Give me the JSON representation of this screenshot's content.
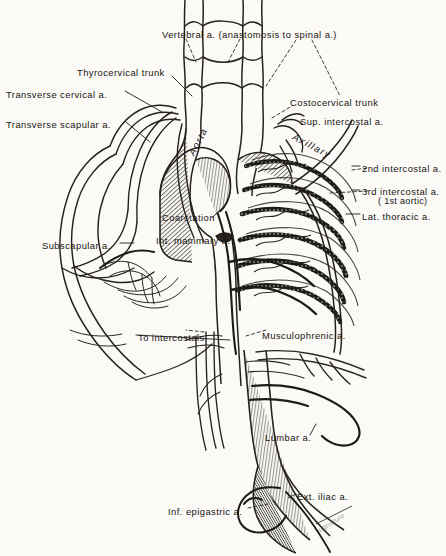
{
  "figure": {
    "background_color": "#fbfaf7",
    "ink_color": "#171512",
    "width": 446,
    "height": 556
  },
  "labels": [
    {
      "id": "vertebral",
      "text": "Vertebral a. (anastomosis to spinal a.)",
      "x": 162,
      "y": 29,
      "align": "left"
    },
    {
      "id": "thyrocervical",
      "text": "Thyrocervical trunk",
      "x": 77,
      "y": 67,
      "align": "left"
    },
    {
      "id": "transverse-cervical",
      "text": "Transverse cervical a.",
      "x": 6,
      "y": 89,
      "align": "left"
    },
    {
      "id": "transverse-scapular",
      "text": "Transverse scapular a.",
      "x": 6,
      "y": 119,
      "align": "left"
    },
    {
      "id": "costocervical",
      "text": "Costocervical trunk",
      "x": 290,
      "y": 97,
      "align": "left"
    },
    {
      "id": "sup-intercostal",
      "text": "Sup. intercostal a.",
      "x": 300,
      "y": 116,
      "align": "left"
    },
    {
      "id": "axillary",
      "text": "Axillary",
      "x": 296,
      "y": 131,
      "align": "left",
      "style": "vessel-script",
      "rotate": 28
    },
    {
      "id": "aorta",
      "text": "Aorta",
      "x": 186,
      "y": 152,
      "align": "left",
      "style": "vessel-script",
      "rotate": -62
    },
    {
      "id": "second-intercostal",
      "text": "2nd intercostal a.",
      "x": 362,
      "y": 163,
      "align": "left"
    },
    {
      "id": "third-intercostal",
      "text": "3rd intercostal a.",
      "x": 362,
      "y": 186,
      "align": "left"
    },
    {
      "id": "third-intercostal-sub",
      "text": "( 1st aortic)",
      "x": 378,
      "y": 196,
      "align": "left",
      "style": "sub"
    },
    {
      "id": "lat-thoracic",
      "text": "Lat. thoracic a.",
      "x": 362,
      "y": 211,
      "align": "left"
    },
    {
      "id": "coarctation",
      "text": "Coarctation",
      "x": 162,
      "y": 212,
      "align": "left"
    },
    {
      "id": "int-mammary",
      "text": "Int. mammary a.",
      "x": 156,
      "y": 235,
      "align": "left"
    },
    {
      "id": "subscapular",
      "text": "Subscapular a.",
      "x": 42,
      "y": 240,
      "align": "left"
    },
    {
      "id": "to-intercostals",
      "text": "To intercostals",
      "x": 138,
      "y": 332,
      "align": "left"
    },
    {
      "id": "musculophrenic",
      "text": "Musculophrenic a.",
      "x": 262,
      "y": 330,
      "align": "left"
    },
    {
      "id": "lumbar",
      "text": "Lumbar a.",
      "x": 265,
      "y": 432,
      "align": "left"
    },
    {
      "id": "ext-iliac",
      "text": "Ext. iliac a.",
      "x": 297,
      "y": 491,
      "align": "left"
    },
    {
      "id": "inf-epigastric",
      "text": "Inf. epigastric a.",
      "x": 168,
      "y": 506,
      "align": "left"
    },
    {
      "id": "artist-signature",
      "text": "signature",
      "x": 316,
      "y": 528,
      "align": "left",
      "style": "signature",
      "rotate": -32
    }
  ],
  "anatomy": {
    "structures": [
      "vertebral arteries with ladder anastomosis",
      "subclavian arteries",
      "thyrocervical trunk",
      "transverse cervical artery",
      "transverse scapular artery",
      "costocervical trunk",
      "superior intercostal artery",
      "axillary artery",
      "aortic arch",
      "coarctation (narrowed aortic segment)",
      "dilated tortuous posterior intercostal arteries",
      "lateral thoracic artery",
      "subscapular artery and scapular anastomosis",
      "internal mammary (thoracic) artery",
      "musculophrenic artery",
      "descending thoracic and abdominal aorta",
      "lumbar arteries",
      "inferior epigastric artery",
      "external iliac arteries"
    ]
  }
}
